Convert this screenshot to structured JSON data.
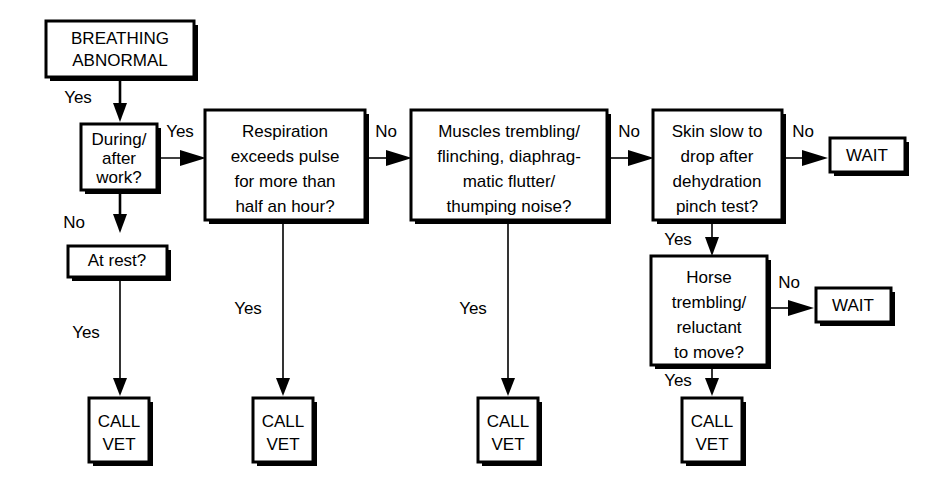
{
  "diagram": {
    "type": "flowchart",
    "background_color": "#ffffff",
    "line_color": "#000000"
  },
  "nodes": {
    "start": {
      "id": "start",
      "kind": "start",
      "lines": [
        "BREATHING",
        "ABNORMAL"
      ]
    },
    "during_after_work": {
      "id": "during_after_work",
      "kind": "decision",
      "lines": [
        "During/",
        "after",
        "work?"
      ]
    },
    "at_rest": {
      "id": "at_rest",
      "kind": "decision",
      "lines": [
        "At rest?"
      ]
    },
    "respiration": {
      "id": "respiration",
      "kind": "decision",
      "lines": [
        "Respiration",
        "exceeds pulse",
        "for more than",
        "half an hour?"
      ]
    },
    "muscles": {
      "id": "muscles",
      "kind": "decision",
      "lines": [
        "Muscles trembling/",
        "flinching, diaphrag-",
        "matic flutter/",
        "thumping noise?"
      ]
    },
    "skin": {
      "id": "skin",
      "kind": "decision",
      "lines": [
        "Skin slow to",
        "drop after",
        "dehydration",
        "pinch  test?"
      ]
    },
    "horse_trembling": {
      "id": "horse_trembling",
      "kind": "decision",
      "lines": [
        "Horse",
        "trembling/",
        "reluctant",
        "to move?"
      ]
    },
    "wait_top": {
      "id": "wait_top",
      "kind": "terminal",
      "lines": [
        "WAIT"
      ]
    },
    "wait_bottom": {
      "id": "wait_bottom",
      "kind": "terminal",
      "lines": [
        "WAIT"
      ]
    },
    "call_vet_1": {
      "id": "call_vet_1",
      "kind": "terminal",
      "lines": [
        "CALL",
        "VET"
      ]
    },
    "call_vet_2": {
      "id": "call_vet_2",
      "kind": "terminal",
      "lines": [
        "CALL",
        "VET"
      ]
    },
    "call_vet_3": {
      "id": "call_vet_3",
      "kind": "terminal",
      "lines": [
        "CALL",
        "VET"
      ]
    },
    "call_vet_4": {
      "id": "call_vet_4",
      "kind": "terminal",
      "lines": [
        "CALL",
        "VET"
      ]
    }
  },
  "edge_labels": {
    "start_to_work": "Yes",
    "work_to_respiration": "Yes",
    "work_to_at_rest": "No",
    "at_rest_to_call_vet_1": "Yes",
    "respiration_to_muscles": "No",
    "respiration_to_call_vet_2": "Yes",
    "muscles_to_skin": "No",
    "muscles_to_call_vet_3": "Yes",
    "skin_to_wait_top": "No",
    "skin_to_horse": "Yes",
    "horse_to_wait_bottom": "No",
    "horse_to_call_vet_4": "Yes"
  }
}
